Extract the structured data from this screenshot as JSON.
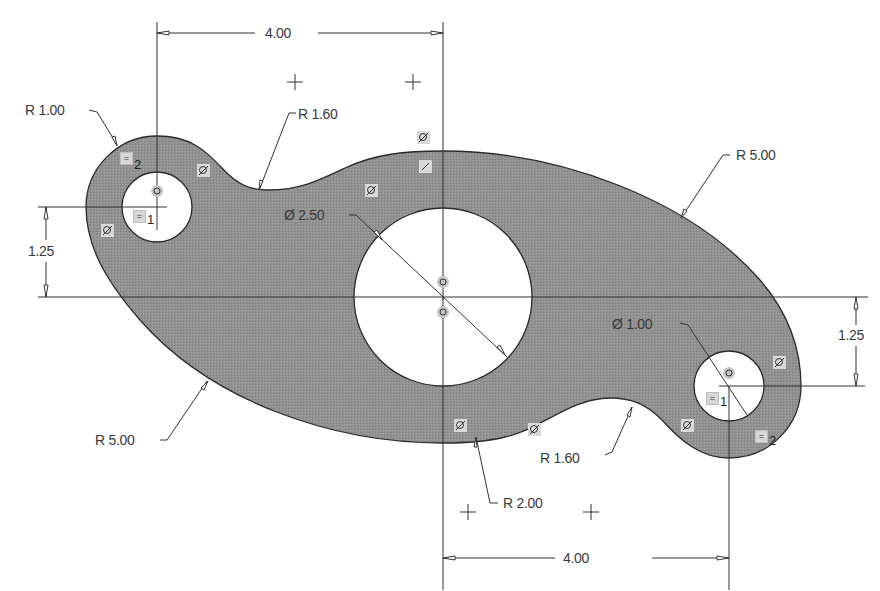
{
  "sketch": {
    "colors": {
      "fill": "#8f8f8f",
      "outline": "#2b2b2b",
      "dimension_line": "#333333",
      "text": "#3a3a3a",
      "background": "#ffffff",
      "constraint_badge": "#d6d6d6"
    },
    "dimensions": {
      "top_horizontal": "4.00",
      "bottom_horizontal": "4.00",
      "left_vertical": "1.25",
      "right_vertical": "1.25",
      "left_boss_radius": "R 1.00",
      "top_fillet_radius": "R 1.60",
      "bottom_fillet_radius": "R 1.60",
      "top_right_arc_radius": "R 5.00",
      "bottom_left_arc_radius": "R 5.00",
      "bottom_hub_radius": "R 2.00",
      "center_hole_diameter": "Ø 2.50",
      "right_hole_diameter": "Ø 1.00"
    },
    "constraints": {
      "equal_1": "1",
      "equal_2": "2",
      "equal_symbol": "=",
      "tangent_symbol": "⊘",
      "coincident_symbol": "◎"
    },
    "geometry": {
      "scale_px_per_unit": 71.5,
      "center_hole": {
        "cx": 443,
        "cy": 297,
        "diameter": 2.5
      },
      "left_hole": {
        "cx": 157,
        "cy": 207,
        "diameter": 1.0,
        "boss_radius": 1.0
      },
      "right_hole": {
        "cx": 729,
        "cy": 386,
        "diameter": 1.0,
        "boss_radius": 1.0
      }
    }
  }
}
